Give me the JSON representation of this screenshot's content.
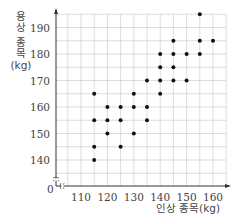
{
  "chart_data": {
    "type": "scatter",
    "title": "",
    "xlabel": "인상 종목(kg)",
    "ylabel": "용상 종목 (kg)",
    "ylabel_lines": [
      "용",
      "상",
      "종",
      "목",
      "(kg)"
    ],
    "xlim": [
      105,
      165
    ],
    "ylim": [
      135,
      195
    ],
    "x_ticks": [
      110,
      120,
      130,
      140,
      150,
      160
    ],
    "y_ticks": [
      140,
      150,
      160,
      170,
      180,
      190
    ],
    "origin_label": "0",
    "axis_break": true,
    "grid": true,
    "grid_step": 5,
    "legend": null,
    "points": [
      [
        115,
        140
      ],
      [
        115,
        145
      ],
      [
        115,
        155
      ],
      [
        115,
        165
      ],
      [
        120,
        150
      ],
      [
        120,
        155
      ],
      [
        120,
        160
      ],
      [
        125,
        145
      ],
      [
        125,
        155
      ],
      [
        125,
        160
      ],
      [
        130,
        150
      ],
      [
        130,
        160
      ],
      [
        130,
        165
      ],
      [
        135,
        155
      ],
      [
        135,
        160
      ],
      [
        135,
        170
      ],
      [
        140,
        165
      ],
      [
        140,
        170
      ],
      [
        140,
        175
      ],
      [
        140,
        180
      ],
      [
        145,
        170
      ],
      [
        145,
        175
      ],
      [
        145,
        180
      ],
      [
        145,
        185
      ],
      [
        150,
        170
      ],
      [
        150,
        180
      ],
      [
        155,
        180
      ],
      [
        155,
        185
      ],
      [
        155,
        195
      ],
      [
        160,
        185
      ]
    ],
    "colors": {
      "point": "#111111",
      "grid": "#cfcfcf",
      "axis": "#333333",
      "text": "#444444"
    }
  }
}
